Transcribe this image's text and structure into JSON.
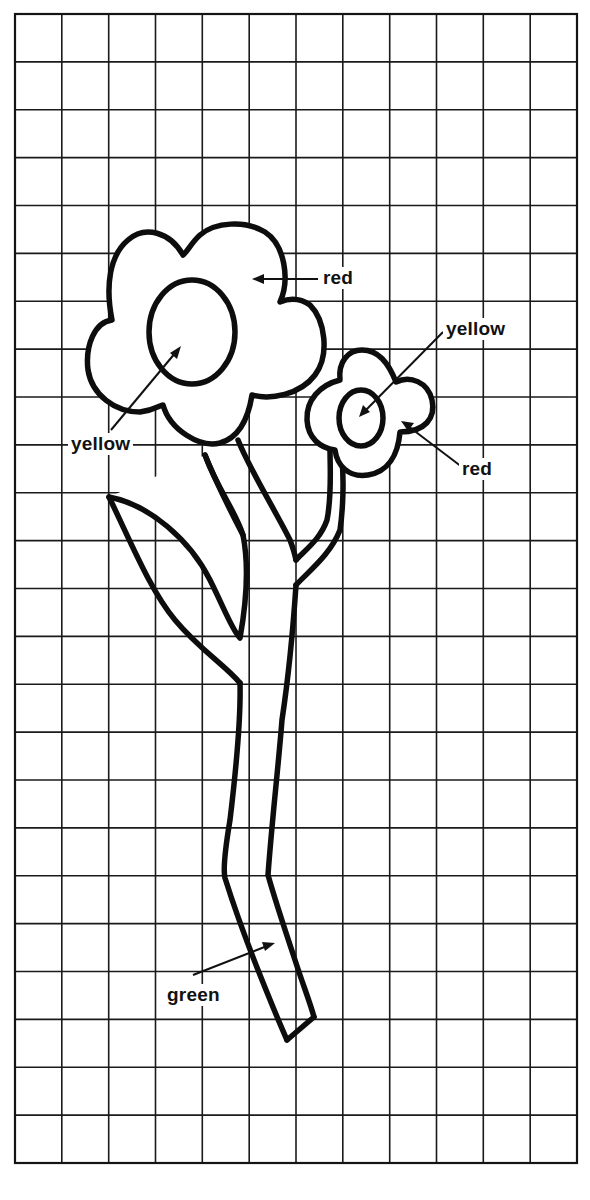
{
  "worksheet": {
    "type": "grid-coloring-guide",
    "grid": {
      "columns": 12,
      "rows": 24,
      "line_color": "#1a1a1a"
    },
    "subject": "two flowers with stems and a leaf",
    "labels": [
      {
        "id": "big-flower-petals",
        "text": "red",
        "color_hex": "#d62828"
      },
      {
        "id": "big-flower-center",
        "text": "yellow",
        "color_hex": "#f2c500"
      },
      {
        "id": "small-flower-center",
        "text": "yellow",
        "color_hex": "#f2c500"
      },
      {
        "id": "small-flower-petals",
        "text": "red",
        "color_hex": "#d62828"
      },
      {
        "id": "stem",
        "text": "green",
        "color_hex": "#2e9e3e"
      }
    ]
  }
}
